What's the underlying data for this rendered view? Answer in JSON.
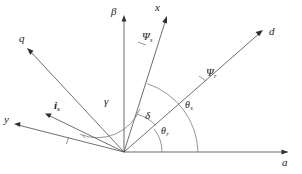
{
  "figure": {
    "type": "vector-axis-diagram",
    "background_color": "#ffffff",
    "line_color": "#4a4a4a",
    "text_color": "#1d1d1d",
    "width": 302,
    "height": 174
  },
  "origin": {
    "x": 124,
    "y": 152
  },
  "axes": [
    {
      "name": "alpha-axis",
      "label": "a",
      "label_x": 282,
      "label_y": 157,
      "tip_x": 292,
      "tip_y": 152,
      "kind": "reference-axis"
    },
    {
      "name": "beta-axis",
      "label": "β",
      "label_x": 111,
      "label_y": 6,
      "tip_x": 124,
      "tip_y": 13,
      "kind": "reference-axis"
    },
    {
      "name": "d-axis",
      "label": "d",
      "label_x": 269,
      "label_y": 26,
      "tip_x": 264,
      "tip_y": 29,
      "kind": "rotor-axis"
    },
    {
      "name": "q-axis",
      "label": "q",
      "label_x": 19,
      "label_y": 33,
      "tip_x": 26,
      "tip_y": 48,
      "kind": "rotor-axis"
    },
    {
      "name": "x-axis",
      "label": "x",
      "label_x": 155,
      "label_y": 2,
      "tip_x": 169,
      "tip_y": 15,
      "kind": "stator-axis"
    },
    {
      "name": "y-axis",
      "label": "y",
      "label_x": 4,
      "label_y": 114,
      "tip_x": 13,
      "tip_y": 126,
      "kind": "stator-axis"
    }
  ],
  "vectors": [
    {
      "name": "current-vector",
      "label": "i",
      "subscript": "s",
      "label_x": 54,
      "label_y": 100,
      "tip_x": 46,
      "tip_y": 114
    }
  ],
  "angles": [
    {
      "name": "gamma-angle",
      "label": "γ",
      "subscript": "",
      "label_x": 104,
      "label_y": 96,
      "radius": 46
    },
    {
      "name": "delta-angle",
      "label": "δ",
      "subscript": "",
      "label_x": 145,
      "label_y": 110,
      "radius": 40
    },
    {
      "name": "theta-r-angle",
      "label": "θ",
      "subscript": "r",
      "label_x": 161,
      "label_y": 126,
      "radius": 38
    },
    {
      "name": "theta-s-angle",
      "label": "θ",
      "subscript": "s",
      "label_x": 185,
      "label_y": 100,
      "radius": 74
    },
    {
      "name": "psi-s-angle",
      "label": "Ψ",
      "subscript": "s",
      "label_x": 142,
      "label_y": 31,
      "radius": 0
    },
    {
      "name": "psi-r-angle",
      "label": "Ψ",
      "subscript": "r",
      "label_x": 206,
      "label_y": 67,
      "radius": 0
    }
  ]
}
